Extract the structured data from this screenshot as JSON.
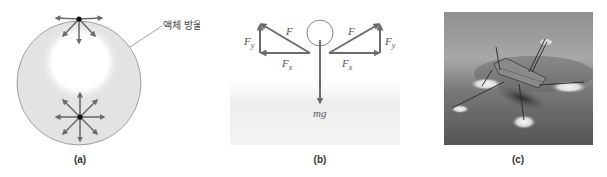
{
  "figure": {
    "panels": [
      {
        "id": "a",
        "caption": "(a)",
        "annotation": "액체 방울",
        "description": "Cross-section of a liquid drop: molecule at surface experiences net inward force; molecule in interior experiences balanced forces in all directions"
      },
      {
        "id": "b",
        "caption": "(b)",
        "labels": {
          "force_left": "F",
          "force_right": "F",
          "fy_left": "F",
          "fy_left_sub": "y",
          "fy_right": "F",
          "fy_right_sub": "y",
          "fx_left": "F",
          "fx_left_sub": "x",
          "fx_right": "F",
          "fx_right_sub": "x",
          "weight": "mg"
        }
      },
      {
        "id": "c",
        "caption": "(c)",
        "description": "Photograph of water strider standing on water surface"
      }
    ],
    "colors": {
      "arrow": "#6b6b6b",
      "drop_fill": "#e3e3e3",
      "drop_outline": "#8a8a8a",
      "dot": "#111111",
      "water_shade": "#ebebeb"
    }
  }
}
